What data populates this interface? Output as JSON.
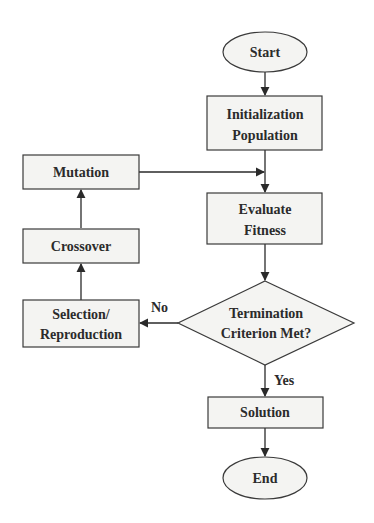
{
  "diagram": {
    "type": "flowchart",
    "title": "",
    "colors": {
      "node_fill": "#f4f4f2",
      "stroke": "#3a3a3a",
      "text": "#2b2b2b",
      "background": "#ffffff"
    },
    "nodes": {
      "start": {
        "shape": "ellipse",
        "label": "Start"
      },
      "init": {
        "shape": "rect",
        "line1": "Initialization",
        "line2": "Population"
      },
      "evaluate": {
        "shape": "rect",
        "line1": "Evaluate",
        "line2": "Fitness"
      },
      "termination": {
        "shape": "diamond",
        "line1": "Termination",
        "line2": "Criterion Met?"
      },
      "selection": {
        "shape": "rect",
        "line1": "Selection/",
        "line2": "Reproduction"
      },
      "crossover": {
        "shape": "rect",
        "label": "Crossover"
      },
      "mutation": {
        "shape": "rect",
        "label": "Mutation"
      },
      "solution": {
        "shape": "rect",
        "label": "Solution"
      },
      "end": {
        "shape": "ellipse",
        "label": "End"
      }
    },
    "edges": [
      {
        "from": "start",
        "to": "init",
        "label": ""
      },
      {
        "from": "init",
        "to": "evaluate",
        "label": ""
      },
      {
        "from": "evaluate",
        "to": "termination",
        "label": ""
      },
      {
        "from": "termination",
        "to": "selection",
        "label": "No"
      },
      {
        "from": "selection",
        "to": "crossover",
        "label": ""
      },
      {
        "from": "crossover",
        "to": "mutation",
        "label": ""
      },
      {
        "from": "mutation",
        "to": "evaluate",
        "label": ""
      },
      {
        "from": "termination",
        "to": "solution",
        "label": "Yes"
      },
      {
        "from": "solution",
        "to": "end",
        "label": ""
      }
    ],
    "edge_labels": {
      "no": "No",
      "yes": "Yes"
    }
  }
}
